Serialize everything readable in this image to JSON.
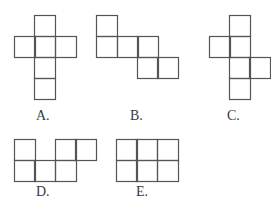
{
  "figure": {
    "line_color": "#555555",
    "square_size": 21,
    "options": [
      {
        "label": "A.",
        "label_pos": [
          36,
          109
        ],
        "squares": [
          [
            34,
            15
          ],
          [
            14,
            36
          ],
          [
            34,
            36
          ],
          [
            55,
            36
          ],
          [
            34,
            57
          ],
          [
            34,
            78
          ]
        ]
      },
      {
        "label": "B.",
        "label_pos": [
          130,
          109
        ],
        "squares": [
          [
            96,
            15
          ],
          [
            96,
            36
          ],
          [
            117,
            36
          ],
          [
            137,
            36
          ],
          [
            137,
            57
          ],
          [
            157,
            57
          ]
        ]
      },
      {
        "label": "C.",
        "label_pos": [
          227,
          109
        ],
        "squares": [
          [
            229,
            15
          ],
          [
            209,
            36
          ],
          [
            229,
            36
          ],
          [
            229,
            57
          ],
          [
            249,
            57
          ],
          [
            229,
            78
          ]
        ]
      },
      {
        "label": "D.",
        "label_pos": [
          36,
          185
        ],
        "squares": [
          [
            14,
            139
          ],
          [
            55,
            139
          ],
          [
            75,
            139
          ],
          [
            14,
            160
          ],
          [
            34,
            160
          ],
          [
            55,
            160
          ]
        ]
      },
      {
        "label": "E.",
        "label_pos": [
          136,
          185
        ],
        "squares": [
          [
            116,
            139
          ],
          [
            136,
            139
          ],
          [
            157,
            139
          ],
          [
            116,
            160
          ],
          [
            136,
            160
          ],
          [
            157,
            160
          ]
        ]
      }
    ]
  }
}
